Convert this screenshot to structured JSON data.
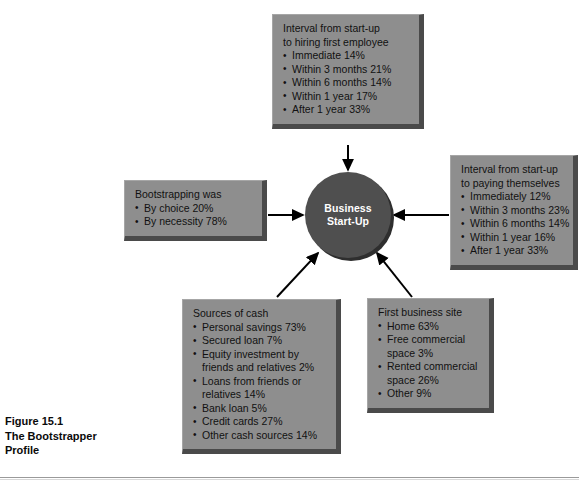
{
  "figure": {
    "number": "Figure 15.1",
    "title_line1": "The Bootstrapper",
    "title_line2": "Profile"
  },
  "center": {
    "line1": "Business",
    "line2": "Start-Up",
    "fill_color": "#4f4f4f",
    "text_color": "#ffffff"
  },
  "style": {
    "box_fill": "#8e8e8e",
    "box_shadow": "#4a4a4a",
    "arrow_color": "#000000",
    "page_background": "#ffffff"
  },
  "boxes": [
    {
      "id": "hiring",
      "title": "Interval from start-up to hiring first employee",
      "title_line1": "Interval from start-up",
      "title_line2": "to hiring first employee",
      "items": [
        {
          "label": "Immediate",
          "value": "14%"
        },
        {
          "label": "Within 3 months",
          "value": "21%"
        },
        {
          "label": "Within 6 months",
          "value": "14%"
        },
        {
          "label": "Within 1 year",
          "value": "17%"
        },
        {
          "label": "After 1 year",
          "value": "33%"
        }
      ]
    },
    {
      "id": "paying",
      "title": "Interval from start-up to paying themselves",
      "title_line1": "Interval from start-up",
      "title_line2": "to paying themselves",
      "items": [
        {
          "label": "Immediately",
          "value": "12%"
        },
        {
          "label": "Within 3 months",
          "value": "23%"
        },
        {
          "label": "Within 6 months",
          "value": "14%"
        },
        {
          "label": "Within 1 year",
          "value": "16%"
        },
        {
          "label": "After 1 year",
          "value": "33%"
        }
      ]
    },
    {
      "id": "bootstrap",
      "title": "Bootstrapping was",
      "title_line1": "Bootstrapping was",
      "title_line2": "",
      "items": [
        {
          "label": "By choice",
          "value": "20%"
        },
        {
          "label": "By necessity",
          "value": "78%"
        }
      ]
    },
    {
      "id": "sources",
      "title": "Sources of cash",
      "title_line1": "Sources of cash",
      "title_line2": "",
      "items": [
        {
          "label": "Personal savings",
          "value": "73%"
        },
        {
          "label": "Secured loan",
          "value": "7%"
        },
        {
          "label": "Equity investment by",
          "label2": "friends and relatives",
          "value": "2%"
        },
        {
          "label": "Loans from friends or",
          "label2": "relatives",
          "value": "14%"
        },
        {
          "label": "Bank loan",
          "value": "5%"
        },
        {
          "label": "Credit cards",
          "value": "27%"
        },
        {
          "label": "Other cash sources",
          "value": "14%"
        }
      ]
    },
    {
      "id": "site",
      "title": "First business site",
      "title_line1": "First business site",
      "title_line2": "",
      "items": [
        {
          "label": "Home",
          "value": "63%"
        },
        {
          "label": "Free commercial",
          "label2": "space",
          "value": "3%"
        },
        {
          "label": "Rented commercial",
          "label2": "space",
          "value": "26%"
        },
        {
          "label": "Other",
          "value": "9%"
        }
      ]
    }
  ]
}
